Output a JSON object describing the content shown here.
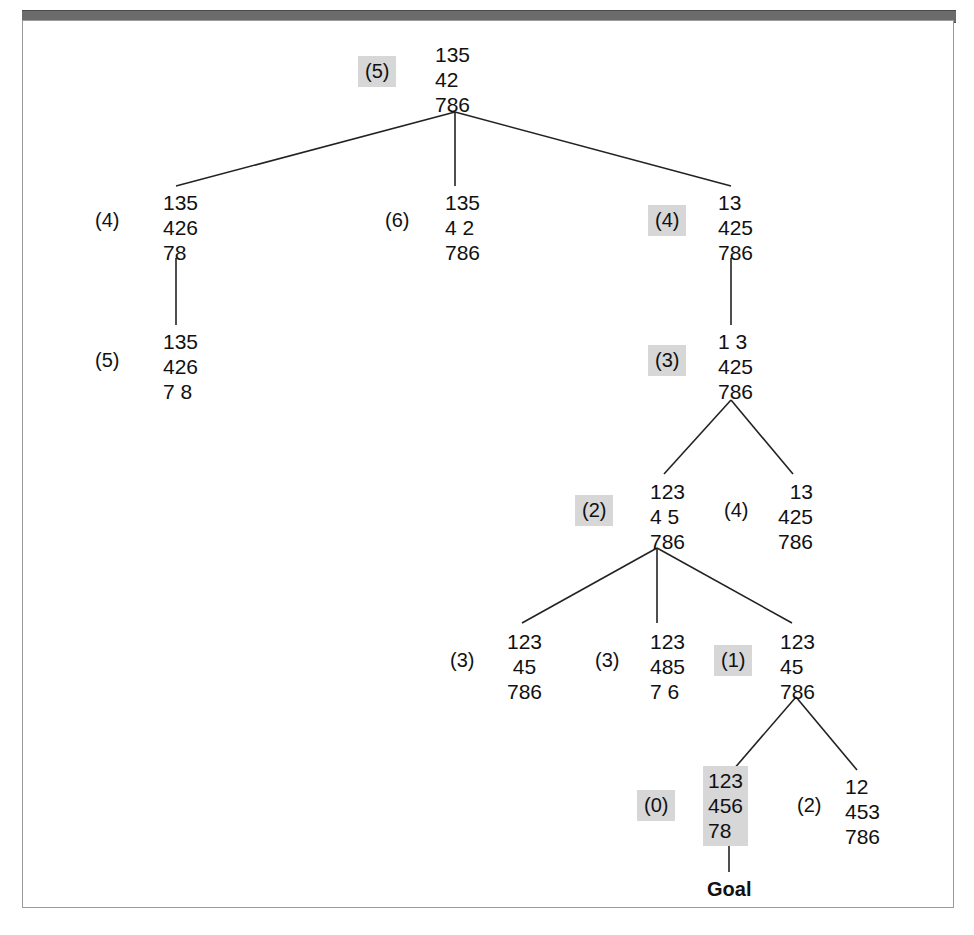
{
  "figure": {
    "goal_label": "Goal",
    "highlight_color": "#d7d7d7",
    "line_color": "#222222",
    "frame_color": "#9a9a9a",
    "top_bar_color": "#6b6b6b"
  },
  "nodes": [
    {
      "id": "n0",
      "cost": "(5)",
      "cost_highlighted": true,
      "rows": [
        "135",
        "42",
        "786"
      ],
      "board_highlighted": false,
      "align": "left",
      "cost_x": 358,
      "cost_y": 56,
      "board_x": 430,
      "board_y": 40
    },
    {
      "id": "n1",
      "cost": "(4)",
      "cost_highlighted": false,
      "rows": [
        "135",
        "426",
        "78"
      ],
      "board_highlighted": false,
      "align": "left",
      "cost_x": 88,
      "cost_y": 205,
      "board_x": 158,
      "board_y": 188
    },
    {
      "id": "n2",
      "cost": "(6)",
      "cost_highlighted": false,
      "rows": [
        "135",
        "4 2",
        "786"
      ],
      "board_highlighted": false,
      "align": "left",
      "cost_x": 378,
      "cost_y": 205,
      "board_x": 440,
      "board_y": 188
    },
    {
      "id": "n3",
      "cost": "(4)",
      "cost_highlighted": true,
      "rows": [
        "13",
        "425",
        "786"
      ],
      "board_highlighted": false,
      "align": "left",
      "cost_x": 648,
      "cost_y": 205,
      "board_x": 713,
      "board_y": 188
    },
    {
      "id": "n4",
      "cost": "(5)",
      "cost_highlighted": false,
      "rows": [
        "135",
        "426",
        "7 8"
      ],
      "board_highlighted": false,
      "align": "left",
      "cost_x": 88,
      "cost_y": 345,
      "board_x": 158,
      "board_y": 327
    },
    {
      "id": "n5",
      "cost": "(3)",
      "cost_highlighted": true,
      "rows": [
        "1 3",
        "425",
        "786"
      ],
      "board_highlighted": false,
      "align": "left",
      "cost_x": 648,
      "cost_y": 345,
      "board_x": 713,
      "board_y": 327
    },
    {
      "id": "n6",
      "cost": "(2)",
      "cost_highlighted": true,
      "rows": [
        "123",
        "4 5",
        "786"
      ],
      "board_highlighted": false,
      "align": "left",
      "cost_x": 575,
      "cost_y": 495,
      "board_x": 645,
      "board_y": 477
    },
    {
      "id": "n7",
      "cost": "(4)",
      "cost_highlighted": false,
      "rows": [
        " 13",
        "425",
        "786"
      ],
      "board_highlighted": false,
      "align": "right",
      "cost_x": 717,
      "cost_y": 495,
      "board_x": 773,
      "board_y": 477
    },
    {
      "id": "n8",
      "cost": "(3)",
      "cost_highlighted": false,
      "rows": [
        "123",
        " 45",
        "786"
      ],
      "board_highlighted": false,
      "align": "left",
      "cost_x": 443,
      "cost_y": 645,
      "board_x": 502,
      "board_y": 627
    },
    {
      "id": "n9",
      "cost": "(3)",
      "cost_highlighted": false,
      "rows": [
        "123",
        "485",
        "7 6"
      ],
      "board_highlighted": false,
      "align": "left",
      "cost_x": 588,
      "cost_y": 645,
      "board_x": 645,
      "board_y": 627
    },
    {
      "id": "n10",
      "cost": "(1)",
      "cost_highlighted": true,
      "rows": [
        "123",
        "45",
        "786"
      ],
      "board_highlighted": false,
      "align": "left",
      "cost_x": 714,
      "cost_y": 645,
      "board_x": 775,
      "board_y": 627
    },
    {
      "id": "n11",
      "cost": "(0)",
      "cost_highlighted": true,
      "rows": [
        "123",
        "456",
        "78"
      ],
      "board_highlighted": true,
      "align": "left",
      "cost_x": 637,
      "cost_y": 790,
      "board_x": 703,
      "board_y": 766
    },
    {
      "id": "n12",
      "cost": "(2)",
      "cost_highlighted": false,
      "rows": [
        "12",
        "453",
        "786"
      ],
      "board_highlighted": false,
      "align": "left",
      "cost_x": 790,
      "cost_y": 790,
      "board_x": 840,
      "board_y": 772
    }
  ],
  "edges": [
    {
      "from": "n0",
      "to": "n1",
      "x1": 455,
      "y1": 112,
      "x2": 176,
      "y2": 186
    },
    {
      "from": "n0",
      "to": "n2",
      "x1": 455,
      "y1": 112,
      "x2": 455,
      "y2": 186
    },
    {
      "from": "n0",
      "to": "n3",
      "x1": 455,
      "y1": 112,
      "x2": 731,
      "y2": 186
    },
    {
      "from": "n1",
      "to": "n4",
      "x1": 176,
      "y1": 258,
      "x2": 176,
      "y2": 325
    },
    {
      "from": "n3",
      "to": "n5",
      "x1": 731,
      "y1": 258,
      "x2": 731,
      "y2": 325
    },
    {
      "from": "n5",
      "to": "n6",
      "x1": 731,
      "y1": 400,
      "x2": 664,
      "y2": 474
    },
    {
      "from": "n5",
      "to": "n7",
      "x1": 731,
      "y1": 400,
      "x2": 793,
      "y2": 474
    },
    {
      "from": "n6",
      "to": "n8",
      "x1": 657,
      "y1": 548,
      "x2": 522,
      "y2": 623
    },
    {
      "from": "n6",
      "to": "n9",
      "x1": 657,
      "y1": 548,
      "x2": 657,
      "y2": 623
    },
    {
      "from": "n6",
      "to": "n10",
      "x1": 657,
      "y1": 548,
      "x2": 792,
      "y2": 623
    },
    {
      "from": "n10",
      "to": "n11",
      "x1": 796,
      "y1": 697,
      "x2": 733,
      "y2": 770
    },
    {
      "from": "n10",
      "to": "n12",
      "x1": 796,
      "y1": 697,
      "x2": 857,
      "y2": 770
    },
    {
      "from": "n11",
      "to": "goal",
      "x1": 729,
      "y1": 843,
      "x2": 729,
      "y2": 872
    }
  ],
  "goal": {
    "label": "Goal",
    "x": 707,
    "y": 878
  }
}
